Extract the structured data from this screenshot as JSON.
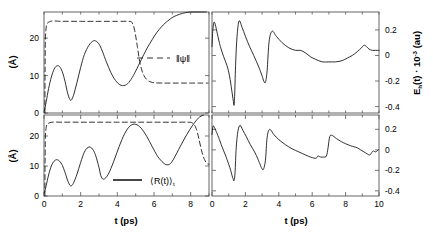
{
  "figure": {
    "title": "",
    "panels": 4,
    "layout": "2x2"
  },
  "chart_data": [
    {
      "id": "top-left",
      "type": "line",
      "title": "",
      "xlabel": "",
      "ylabel": "(Å)",
      "xlim": [
        0,
        9
      ],
      "ylim": [
        0,
        27
      ],
      "xticks": [
        0,
        1,
        2,
        3,
        4,
        5,
        6,
        7,
        8,
        9
      ],
      "xticklabels": [
        "",
        "",
        "",
        "",
        "",
        "",
        "",
        "",
        "",
        ""
      ],
      "yticks": [
        0,
        10,
        20
      ],
      "yticklabels": [
        "0",
        "10",
        "20"
      ],
      "grid": false,
      "legend": {
        "position": "center-right",
        "entries": [
          {
            "label": "‖ψ‖",
            "style": "dashed"
          }
        ]
      },
      "series": [
        {
          "name": "⟨R(t)⟩",
          "style": "solid",
          "color": "#1a1a1a",
          "x": [
            0.02,
            0.12,
            0.25,
            0.4,
            0.55,
            0.7,
            0.85,
            1.0,
            1.15,
            1.3,
            1.45,
            1.6,
            1.8,
            2.0,
            2.2,
            2.45,
            2.7,
            2.9,
            3.05,
            3.2,
            3.4,
            3.65,
            3.9,
            4.2,
            4.5,
            4.75,
            5.0,
            5.3,
            5.6,
            5.9,
            6.15,
            6.4,
            6.6,
            6.75,
            6.9,
            7.1,
            7.4,
            7.7,
            8.0,
            8.3,
            8.6,
            8.85
          ],
          "y": [
            0.6,
            3.0,
            6.5,
            9.6,
            11.7,
            12.6,
            12.4,
            11.0,
            8.4,
            5.1,
            3.4,
            4.6,
            8.2,
            12.2,
            15.6,
            18.1,
            19.3,
            19.0,
            18.0,
            16.3,
            13.7,
            10.8,
            8.7,
            7.4,
            7.6,
            9.0,
            11.2,
            14.2,
            17.1,
            19.6,
            21.5,
            23.0,
            24.0,
            24.6,
            25.2,
            25.8,
            26.4,
            26.8,
            27.0,
            27.0,
            27.0,
            27.0
          ]
        },
        {
          "name": "‖ψ‖",
          "style": "dashed",
          "color": "#1a1a1a",
          "x": [
            0.05,
            0.06,
            0.1,
            0.3,
            1.0,
            2.0,
            3.0,
            4.0,
            4.6,
            4.8,
            4.95,
            5.1,
            5.25,
            5.45,
            5.7,
            6.0,
            6.5,
            7.0,
            7.5,
            8.0,
            8.5,
            8.95
          ],
          "y": [
            0.0,
            12.0,
            22.0,
            24.4,
            24.5,
            24.5,
            24.5,
            24.5,
            24.5,
            24.2,
            22.0,
            17.5,
            13.0,
            10.0,
            8.6,
            8.1,
            8.0,
            8.0,
            8.0,
            8.0,
            8.0,
            8.0
          ]
        }
      ]
    },
    {
      "id": "top-right",
      "type": "line",
      "title": "",
      "xlabel": "",
      "ylabel": "E_h(t) · 10⁻³ (au)",
      "ylabel_parts": {
        "main": "E",
        "sub": "h",
        "mid": "(t) · 10",
        "sup": "-3",
        "tail": " (au)"
      },
      "xlim": [
        0,
        10
      ],
      "ylim": [
        -0.45,
        0.34
      ],
      "xticks": [
        0,
        1,
        2,
        3,
        4,
        5,
        6,
        7,
        8,
        9,
        10
      ],
      "xticklabels": [
        "",
        "",
        "",
        "",
        "",
        "",
        "",
        "",
        "",
        "",
        ""
      ],
      "yticks": [
        0.2,
        0,
        -0.2,
        -0.4
      ],
      "yticklabels": [
        "0.2",
        "0",
        "-0.2",
        "-0.4"
      ],
      "grid": false,
      "legend": null,
      "series": [
        {
          "name": "E_h(t)",
          "style": "solid",
          "color": "#1a1a1a",
          "x": [
            0.0,
            0.05,
            0.12,
            0.2,
            0.32,
            0.5,
            0.7,
            0.9,
            1.05,
            1.18,
            1.26,
            1.32,
            1.36,
            1.42,
            1.5,
            1.62,
            1.8,
            2.0,
            2.25,
            2.5,
            2.8,
            3.0,
            3.1,
            3.2,
            3.3,
            3.42,
            3.6,
            3.85,
            4.2,
            4.6,
            5.0,
            5.3,
            5.6,
            5.9,
            6.2,
            6.6,
            7.0,
            7.4,
            7.8,
            8.1,
            8.4,
            8.7,
            8.95,
            9.1,
            9.25,
            9.4,
            9.6,
            9.8,
            10.0
          ],
          "y": [
            0.07,
            0.2,
            0.26,
            0.24,
            0.17,
            0.07,
            -0.01,
            -0.08,
            -0.16,
            -0.27,
            -0.34,
            -0.39,
            -0.3,
            -0.05,
            0.15,
            0.27,
            0.22,
            0.15,
            0.07,
            0.0,
            -0.09,
            -0.16,
            -0.2,
            -0.21,
            -0.12,
            0.11,
            0.19,
            0.15,
            0.1,
            0.06,
            0.04,
            0.04,
            0.02,
            -0.01,
            -0.03,
            -0.05,
            -0.05,
            -0.05,
            -0.04,
            -0.02,
            0.0,
            0.03,
            0.06,
            0.08,
            0.07,
            0.05,
            0.04,
            0.04,
            0.04
          ]
        }
      ]
    },
    {
      "id": "bottom-left",
      "type": "line",
      "title": "",
      "xlabel": "t (ps)",
      "ylabel": "(Å)",
      "xlim": [
        0,
        9
      ],
      "ylim": [
        0,
        27
      ],
      "xticks": [
        0,
        1,
        2,
        3,
        4,
        5,
        6,
        7,
        8,
        9
      ],
      "xticklabels": [
        "0",
        "",
        "2",
        "",
        "4",
        "",
        "6",
        "",
        "8",
        ""
      ],
      "yticks": [
        0,
        10,
        20
      ],
      "yticklabels": [
        "0",
        "10",
        "20"
      ],
      "grid": false,
      "legend": {
        "position": "center",
        "entries": [
          {
            "label": "⟨R(t)⟩t",
            "style": "solid"
          }
        ]
      },
      "series": [
        {
          "name": "⟨R(t)⟩_t",
          "style": "solid",
          "color": "#1a1a1a",
          "x": [
            0.02,
            0.12,
            0.25,
            0.4,
            0.55,
            0.7,
            0.85,
            1.0,
            1.15,
            1.3,
            1.45,
            1.6,
            1.8,
            2.0,
            2.2,
            2.4,
            2.6,
            2.8,
            3.0,
            3.1,
            3.25,
            3.5,
            3.8,
            4.1,
            4.4,
            4.7,
            5.0,
            5.3,
            5.6,
            5.9,
            6.2,
            6.5,
            6.7,
            6.85,
            7.0,
            7.2,
            7.5,
            7.8,
            8.1,
            8.35,
            8.5,
            8.7
          ],
          "y": [
            1.0,
            3.5,
            7.0,
            10.0,
            11.6,
            12.1,
            11.6,
            10.2,
            7.8,
            5.0,
            3.4,
            4.2,
            7.3,
            11.2,
            14.6,
            16.2,
            16.0,
            13.8,
            9.5,
            6.8,
            5.6,
            7.2,
            11.5,
            16.5,
            20.8,
            23.4,
            23.9,
            22.6,
            19.9,
            16.5,
            13.2,
            11.1,
            10.4,
            10.6,
            11.6,
            13.8,
            17.3,
            20.6,
            23.5,
            25.5,
            26.4,
            27.0
          ]
        },
        {
          "name": "‖ψ‖",
          "style": "dashed",
          "color": "#1a1a1a",
          "x": [
            0.05,
            0.06,
            0.1,
            0.3,
            1.0,
            2.0,
            3.0,
            4.0,
            5.0,
            6.0,
            7.0,
            7.8,
            8.1,
            8.3,
            8.45,
            8.6,
            8.75,
            8.9,
            9.0
          ],
          "y": [
            0.0,
            12.0,
            22.0,
            24.4,
            24.6,
            24.6,
            24.6,
            24.6,
            24.6,
            24.6,
            24.6,
            24.6,
            24.3,
            22.5,
            19.0,
            15.0,
            12.2,
            10.8,
            10.6
          ]
        }
      ]
    },
    {
      "id": "bottom-right",
      "type": "line",
      "title": "",
      "xlabel": "t (ps)",
      "ylabel": "",
      "xlim": [
        0,
        10
      ],
      "ylim": [
        -0.45,
        0.34
      ],
      "xticks": [
        0,
        1,
        2,
        3,
        4,
        5,
        6,
        7,
        8,
        9,
        10
      ],
      "xticklabels": [
        "0",
        "",
        "2",
        "",
        "4",
        "",
        "6",
        "",
        "8",
        "",
        "10"
      ],
      "yticks": [
        0.2,
        0,
        -0.2,
        -0.4
      ],
      "yticklabels": [
        "0.2",
        "0",
        "-0.2",
        "-0.4"
      ],
      "grid": false,
      "legend": null,
      "series": [
        {
          "name": "E_h(t)",
          "style": "solid",
          "color": "#1a1a1a",
          "x": [
            0.0,
            0.06,
            0.14,
            0.25,
            0.4,
            0.6,
            0.8,
            1.0,
            1.12,
            1.2,
            1.26,
            1.32,
            1.38,
            1.45,
            1.55,
            1.68,
            1.85,
            2.05,
            2.3,
            2.55,
            2.75,
            2.9,
            2.98,
            3.08,
            3.2,
            3.3,
            3.45,
            3.7,
            4.0,
            4.4,
            4.8,
            5.2,
            5.6,
            5.9,
            6.1,
            6.25,
            6.35,
            6.5,
            6.7,
            6.85,
            6.95,
            7.05,
            7.2,
            7.45,
            7.75,
            8.0,
            8.3,
            8.5,
            8.7,
            8.9,
            9.1,
            9.3,
            9.45,
            9.55,
            9.65,
            9.8,
            9.95
          ],
          "y": [
            0.15,
            0.23,
            0.22,
            0.18,
            0.12,
            0.03,
            -0.05,
            -0.14,
            -0.2,
            -0.25,
            -0.28,
            -0.3,
            -0.22,
            0.02,
            0.18,
            0.24,
            0.19,
            0.13,
            0.05,
            -0.02,
            -0.09,
            -0.15,
            -0.18,
            -0.19,
            -0.1,
            0.12,
            0.2,
            0.15,
            0.1,
            0.05,
            0.01,
            -0.02,
            -0.05,
            -0.07,
            -0.08,
            -0.08,
            -0.06,
            -0.07,
            -0.07,
            -0.06,
            0.02,
            0.13,
            0.14,
            0.11,
            0.08,
            0.06,
            0.04,
            0.03,
            0.02,
            0.0,
            -0.02,
            -0.04,
            -0.05,
            -0.03,
            -0.01,
            -0.02,
            0.0
          ]
        }
      ]
    }
  ],
  "labels": {
    "y_left_top": "(Å)",
    "y_left_bottom": "(Å)",
    "x_left": "t (ps)",
    "x_right": "t (ps)",
    "y_right_main": "E",
    "y_right_sub": "h",
    "y_right_mid": "(t) · 10",
    "y_right_sup": "-3",
    "y_right_tail": "(au)",
    "legend_psi": "‖ψ‖",
    "legend_R_main": "⟨R(t)⟩",
    "legend_R_sub": "t"
  },
  "colors": {
    "line": "#1a1a1a",
    "axis": "#555555",
    "background": "#ffffff"
  }
}
